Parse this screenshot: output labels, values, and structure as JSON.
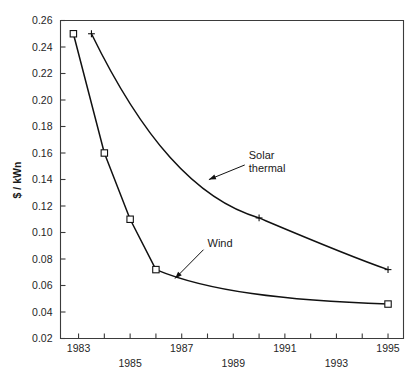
{
  "chart_data": {
    "type": "line",
    "title": "",
    "xlabel": "",
    "ylabel": "$ / kWn",
    "xlim": [
      1982.3,
      1995.6
    ],
    "ylim": [
      0.02,
      0.26
    ],
    "grid": false,
    "legend": "annotations-on-plot",
    "x_ticks": [
      1983,
      1984,
      1985,
      1986,
      1987,
      1988,
      1989,
      1990,
      1991,
      1992,
      1993,
      1994,
      1995
    ],
    "x_tick_labels_row1": [
      "1983",
      "1987",
      "1991",
      "1995"
    ],
    "x_tick_labels_row2": [
      "1985",
      "1989",
      "1993"
    ],
    "y_ticks": [
      0.02,
      0.04,
      0.06,
      0.08,
      0.1,
      0.12,
      0.14,
      0.16,
      0.18,
      0.2,
      0.22,
      0.24,
      0.26
    ],
    "y_tick_labels": [
      "0.02",
      "0.04",
      "0.06",
      "0.08",
      "0.10",
      "0.12",
      "0.14",
      "0.16",
      "0.18",
      "0.20",
      "0.22",
      "0.24",
      "0.26"
    ],
    "series": [
      {
        "name": "Wind",
        "marker": "square",
        "x": [
          1982.8,
          1984.0,
          1985.0,
          1986.0,
          1995.0
        ],
        "values": [
          0.25,
          0.16,
          0.11,
          0.072,
          0.046
        ]
      },
      {
        "name": "Solar thermal",
        "marker": "plus",
        "x": [
          1983.5,
          1990.0,
          1995.0
        ],
        "values": [
          0.25,
          0.111,
          0.072
        ]
      }
    ],
    "annotations": [
      {
        "label_line1": "Solar",
        "label_line2": "thermal",
        "text_x": 1989.6,
        "text_y": 0.1555,
        "arrow_to_x": 1988.0,
        "arrow_to_y": 0.1395
      },
      {
        "label_line1": "Wind",
        "label_line2": "",
        "text_x": 1988.0,
        "text_y": 0.0893,
        "arrow_to_x": 1986.7,
        "arrow_to_y": 0.0645
      }
    ]
  }
}
